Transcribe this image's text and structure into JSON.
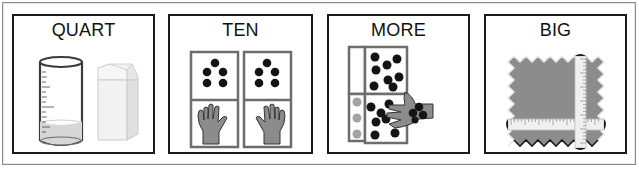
{
  "cards": [
    {
      "label": "QUART",
      "icon": "measuring-cup-and-milk-carton"
    },
    {
      "label": "TEN",
      "icon": "ten-fingers-dots"
    },
    {
      "label": "MORE",
      "icon": "hand-adding-counters"
    },
    {
      "label": "BIG",
      "icon": "fabric-with-tape-measure"
    }
  ],
  "colors": {
    "border": "#1a1a1a",
    "illustration_gray": "#8c8c8c",
    "dot": "#141414",
    "light_dot": "#a8a8a8",
    "liquid": "#d6d6d6"
  }
}
